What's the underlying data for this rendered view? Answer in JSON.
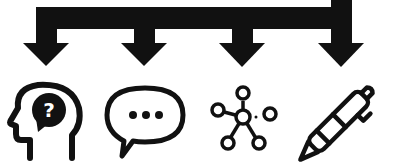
{
  "diagram": {
    "type": "branching-arrows",
    "connector": {
      "description": "Single source arrow entering from top-right, splitting into four downward arrows",
      "color": "#111111",
      "branch_count": 4
    },
    "icons": [
      {
        "id": "head-question",
        "name": "head-with-question-mark",
        "glyph": "?"
      },
      {
        "id": "speech-bubble",
        "name": "speech-bubble-with-ellipsis",
        "glyph": "..."
      },
      {
        "id": "network",
        "name": "network-nodes-hub"
      },
      {
        "id": "pen",
        "name": "ballpoint-pen"
      }
    ],
    "colors": {
      "foreground": "#111111",
      "background": "#ffffff"
    }
  }
}
